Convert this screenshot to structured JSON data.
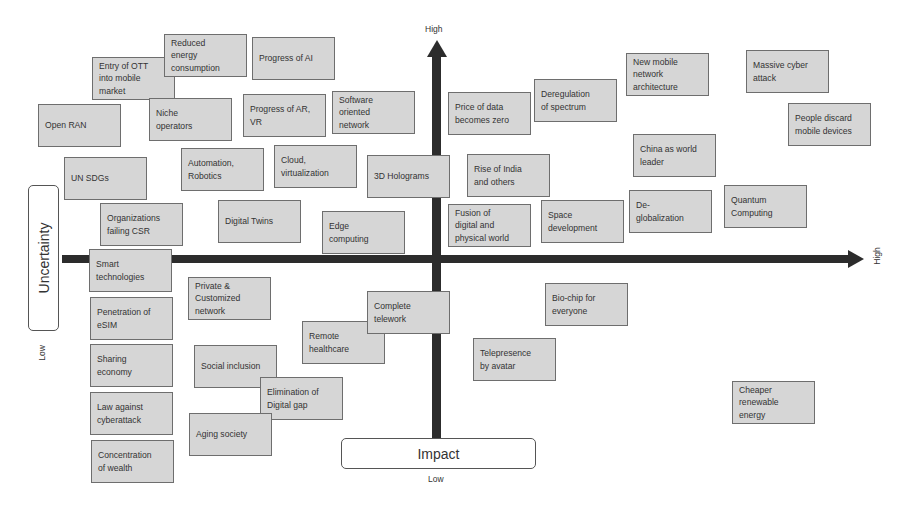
{
  "axes": {
    "vertical": {
      "top_label": "High",
      "bottom_label": "Low",
      "name": "Impact"
    },
    "horizontal": {
      "right_label": "High",
      "left_label": "Low",
      "name": "Uncertainty"
    },
    "arrow_color": "#2c2c2c"
  },
  "box_style": {
    "fill": "#d6d6d6",
    "border": "#6e6e6e",
    "text": "#333333"
  },
  "items": [
    {
      "lines": [
        "Entry of OTT",
        "into mobile",
        "market"
      ],
      "x": 92,
      "y": 57
    },
    {
      "lines": [
        "Reduced",
        "energy",
        "consumption"
      ],
      "x": 164,
      "y": 34
    },
    {
      "lines": [
        "Progress of AI"
      ],
      "x": 252,
      "y": 37
    },
    {
      "lines": [
        "Open RAN"
      ],
      "x": 38,
      "y": 104
    },
    {
      "lines": [
        "Niche",
        "operators"
      ],
      "x": 149,
      "y": 98
    },
    {
      "lines": [
        "Progress of AR,",
        "VR"
      ],
      "x": 243,
      "y": 94
    },
    {
      "lines": [
        "Software",
        "oriented",
        "network"
      ],
      "x": 332,
      "y": 91
    },
    {
      "lines": [
        "UN SDGs"
      ],
      "x": 64,
      "y": 157
    },
    {
      "lines": [
        "Automation,",
        "Robotics"
      ],
      "x": 181,
      "y": 148
    },
    {
      "lines": [
        "Cloud,",
        "virtualization"
      ],
      "x": 274,
      "y": 145
    },
    {
      "lines": [
        "3D Holograms"
      ],
      "x": 367,
      "y": 155
    },
    {
      "lines": [
        "Organizations",
        "failing CSR"
      ],
      "x": 100,
      "y": 203
    },
    {
      "lines": [
        "Digital Twins"
      ],
      "x": 218,
      "y": 200
    },
    {
      "lines": [
        "Edge",
        "computing"
      ],
      "x": 322,
      "y": 211
    },
    {
      "lines": [
        "Smart",
        "technologies"
      ],
      "x": 89,
      "y": 249
    },
    {
      "lines": [
        "Price of data",
        "becomes zero"
      ],
      "x": 448,
      "y": 92
    },
    {
      "lines": [
        "Deregulation",
        "of spectrum"
      ],
      "x": 534,
      "y": 79
    },
    {
      "lines": [
        "New mobile",
        "network",
        "architecture"
      ],
      "x": 626,
      "y": 53
    },
    {
      "lines": [
        "Massive cyber",
        "attack"
      ],
      "x": 746,
      "y": 50
    },
    {
      "lines": [
        "People discard",
        "mobile devices"
      ],
      "x": 788,
      "y": 103
    },
    {
      "lines": [
        "China as world",
        "leader"
      ],
      "x": 633,
      "y": 134
    },
    {
      "lines": [
        "Rise of India",
        "and others"
      ],
      "x": 467,
      "y": 154
    },
    {
      "lines": [
        "Fusion of",
        "digital and",
        "physical world"
      ],
      "x": 448,
      "y": 204
    },
    {
      "lines": [
        "Space",
        "development"
      ],
      "x": 541,
      "y": 200
    },
    {
      "lines": [
        "De-",
        "globalization"
      ],
      "x": 629,
      "y": 190
    },
    {
      "lines": [
        "Quantum",
        "Computing"
      ],
      "x": 724,
      "y": 185
    },
    {
      "lines": [
        "Private &",
        "Customized",
        "network"
      ],
      "x": 188,
      "y": 277
    },
    {
      "lines": [
        "Penetration of",
        "eSIM"
      ],
      "x": 90,
      "y": 297
    },
    {
      "lines": [
        "Remote",
        "healthcare"
      ],
      "x": 302,
      "y": 321
    },
    {
      "lines": [
        "Complete",
        "telework"
      ],
      "x": 367,
      "y": 291
    },
    {
      "lines": [
        "Bio-chip for",
        "everyone"
      ],
      "x": 545,
      "y": 283
    },
    {
      "lines": [
        "Telepresence",
        "by avatar"
      ],
      "x": 473,
      "y": 338
    },
    {
      "lines": [
        "Sharing",
        "economy"
      ],
      "x": 90,
      "y": 344
    },
    {
      "lines": [
        "Social inclusion"
      ],
      "x": 194,
      "y": 345
    },
    {
      "lines": [
        "Elimination of",
        "Digital gap"
      ],
      "x": 260,
      "y": 377
    },
    {
      "lines": [
        "Law against",
        "cyberattack"
      ],
      "x": 90,
      "y": 392
    },
    {
      "lines": [
        "Aging society"
      ],
      "x": 189,
      "y": 413
    },
    {
      "lines": [
        "Concentration",
        "of wealth"
      ],
      "x": 91,
      "y": 440
    },
    {
      "lines": [
        "Cheaper",
        "renewable",
        "energy"
      ],
      "x": 732,
      "y": 381
    }
  ]
}
